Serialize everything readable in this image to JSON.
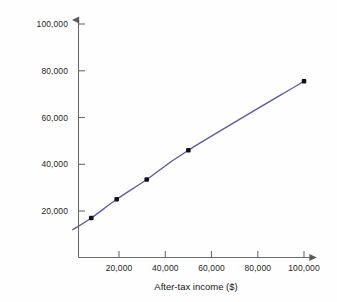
{
  "chart_data": {
    "type": "line",
    "title": "",
    "xlabel": "After-tax income ($)",
    "ylabel": "Total expenses ($)",
    "xlim": [
      0,
      110000
    ],
    "ylim": [
      0,
      105000
    ],
    "grid": false,
    "legend": "none",
    "line_color": "#5a5aa8",
    "marker_color": "#111118",
    "axis_color": "#6b6b6b",
    "x_ticks": [
      20000,
      40000,
      60000,
      80000,
      100000
    ],
    "y_ticks": [
      20000,
      40000,
      60000,
      80000,
      100000
    ],
    "x_tick_labels": [
      "20,000",
      "40,000",
      "60,000",
      "80,000",
      "100,000"
    ],
    "y_tick_labels": [
      "20,000",
      "40,000",
      "60,000",
      "80,000",
      "100,000"
    ],
    "series": [
      {
        "name": "Total expenses",
        "x": [
          8000,
          19000,
          32000,
          50000,
          100000
        ],
        "y": [
          17000,
          25000,
          33500,
          46000,
          75500
        ]
      }
    ],
    "fit_curve": {
      "name": "fitted trend",
      "x": [
        0,
        8000,
        19000,
        32000,
        50000,
        100000
      ],
      "y": [
        12000,
        17000,
        25000,
        33500,
        46000,
        75500
      ]
    }
  },
  "axes": {
    "y_axis_name": "y-axis",
    "x_axis_name": "x-axis"
  }
}
